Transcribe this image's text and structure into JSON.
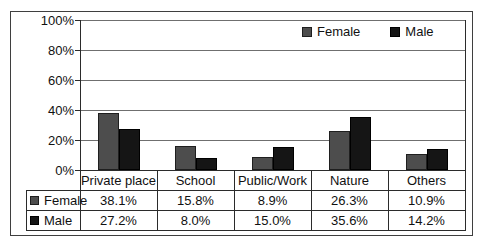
{
  "chart_data": {
    "type": "bar",
    "title": "",
    "categories": [
      "Private place",
      "School",
      "Public/Work",
      "Nature",
      "Others"
    ],
    "series": [
      {
        "name": "Female",
        "values": [
          38.1,
          15.8,
          8.9,
          26.3,
          10.9
        ],
        "color": "#4d4d4d",
        "border_color": "#1f1f1f"
      },
      {
        "name": "Male",
        "values": [
          27.2,
          8.0,
          15.0,
          35.6,
          14.2
        ],
        "color": "#151515",
        "border_color": "#000000"
      }
    ],
    "y_ticks": [
      "100%",
      "80%",
      "60%",
      "40%",
      "20%",
      "0%"
    ],
    "ylim": [
      0,
      100
    ],
    "grid": true,
    "legend_position": "top-right-inside",
    "data_table": {
      "rows": [
        {
          "label": "Female",
          "cells": [
            "38.1%",
            "15.8%",
            "8.9%",
            "26.3%",
            "10.9%"
          ]
        },
        {
          "label": "Male",
          "cells": [
            "27.2%",
            "8.0%",
            "15.0%",
            "35.6%",
            "14.2%"
          ]
        }
      ]
    }
  },
  "colors": {
    "background": "#ffffff",
    "frame_border": "#3f3f3f",
    "gridline": "#6f6f6f",
    "axis": "#2b2b2b",
    "table_border": "#2b2b2b",
    "text": "#111111"
  }
}
